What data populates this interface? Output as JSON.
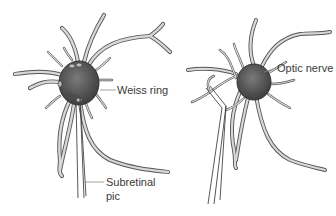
{
  "figure": {
    "panels": [
      {
        "id": "left",
        "description": "Optic disc with surrounding retinal vessels and subretinal pic instrument",
        "labels": [
          {
            "text": "Weiss ring",
            "x": 117,
            "y": 84
          },
          {
            "text": "Subretinal",
            "x": 106,
            "y": 176
          },
          {
            "text": "pic",
            "x": 106,
            "y": 190
          }
        ]
      },
      {
        "id": "right",
        "description": "Optic disc with surrounding retinal vessels; instrument lifting vessel",
        "labels": [
          {
            "text": "Optic nerve",
            "x": 277,
            "y": 62
          }
        ]
      }
    ],
    "colors": {
      "disc": "#5a5a5a",
      "vessel_outline": "#555555",
      "vessel_fill": "#d8d8d8",
      "label_text": "#3a3a3a",
      "background": "#ffffff"
    }
  }
}
